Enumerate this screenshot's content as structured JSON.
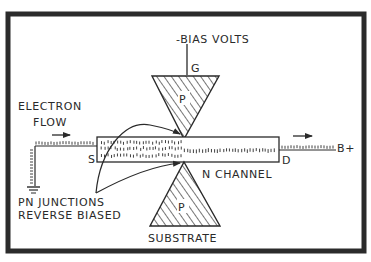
{
  "diagram": {
    "colors": {
      "frame": "#2b2b2b",
      "ink": "#2a2a2a",
      "background": "#ffffff"
    },
    "labels": {
      "bias": "-BIAS VOLTS",
      "gate": "G",
      "gate_region": "P",
      "electron_flow_line1": "ELECTRON",
      "electron_flow_line2": "FLOW",
      "source": "S",
      "drain": "D",
      "supply": "B+",
      "channel": "N CHANNEL",
      "junctions_line1": "PN JUNCTIONS",
      "junctions_line2": "REVERSE BIASED",
      "substrate_region": "P",
      "substrate": "SUBSTRATE"
    }
  }
}
